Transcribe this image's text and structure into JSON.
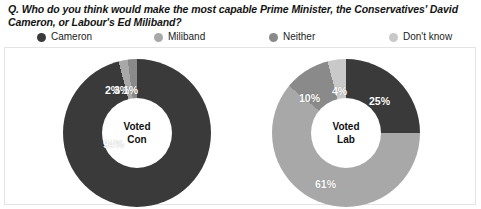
{
  "question": "Q. Who do you think would make the most capable Prime Minister, the Conservatives' David Cameron, or Labour's Ed Miliband?",
  "legend": {
    "items": [
      {
        "label": "Cameron",
        "color": "#3a3a3a"
      },
      {
        "label": "Miliband",
        "color": "#a8a8a8"
      },
      {
        "label": "Neither",
        "color": "#8a8a8a"
      },
      {
        "label": "Don't know",
        "color": "#c9c9c9"
      }
    ]
  },
  "colors": {
    "cameron": "#3a3a3a",
    "miliband": "#a8a8a8",
    "neither": "#8a8a8a",
    "dont_know": "#c9c9c9",
    "hole": "#ffffff",
    "label_text": "#ffffff"
  },
  "charts": [
    {
      "center_line1": "Voted",
      "center_line2": "Con",
      "labels": [
        "94%",
        "2%",
        "3%",
        "1%"
      ]
    },
    {
      "center_line1": "Voted",
      "center_line2": "Lab",
      "labels": [
        "25%",
        "61%",
        "10%",
        "4%"
      ]
    }
  ],
  "chart_data": [
    {
      "type": "pie",
      "title": "Voted Con",
      "categories": [
        "Cameron",
        "Miliband",
        "Neither",
        "Don't know"
      ],
      "values": [
        94,
        2,
        3,
        1
      ],
      "unit": "%",
      "donut": true,
      "legend_position": "top"
    },
    {
      "type": "pie",
      "title": "Voted Lab",
      "categories": [
        "Cameron",
        "Miliband",
        "Neither",
        "Don't know"
      ],
      "values": [
        25,
        61,
        10,
        4
      ],
      "unit": "%",
      "donut": true,
      "legend_position": "top"
    }
  ]
}
